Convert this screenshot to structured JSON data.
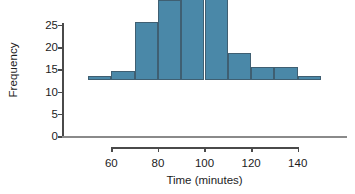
{
  "chart_data": {
    "type": "bar",
    "title": "",
    "subtitle": "",
    "xlabel": "Time (minutes)",
    "ylabel": "Frequency",
    "bin_width": 10,
    "bin_edges": [
      50,
      60,
      70,
      80,
      90,
      100,
      110,
      120,
      130,
      140,
      150
    ],
    "categories": [
      "50-60",
      "60-70",
      "70-80",
      "80-90",
      "90-100",
      "100-110",
      "110-120",
      "120-130",
      "130-140",
      "140-150"
    ],
    "values": [
      1,
      2,
      13,
      18,
      28,
      25,
      6,
      3,
      3,
      1
    ],
    "bin_centers": [
      55,
      65,
      75,
      85,
      95,
      105,
      115,
      125,
      135,
      145
    ],
    "xlim": [
      50,
      150
    ],
    "ylim": [
      0,
      28
    ],
    "xticks": [
      60,
      80,
      100,
      120,
      140
    ],
    "xtick_labels": [
      "60",
      "80",
      "100",
      "120",
      "140"
    ],
    "yticks": [
      0,
      5,
      10,
      15,
      20,
      25
    ],
    "ytick_labels": [
      "0",
      "5",
      "10",
      "15",
      "20",
      "25"
    ],
    "grid": false,
    "legend": null,
    "bar_fill_color": "#4a88a8",
    "bar_edge_color": "#3f5f72",
    "axis_color": "#4a4a4a",
    "baseline_color": "#8a8a8a",
    "text_color": "#1c1c1c"
  }
}
